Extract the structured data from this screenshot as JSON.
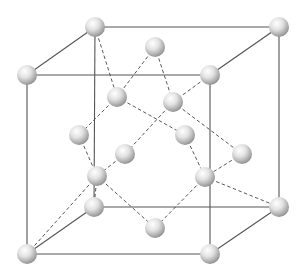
{
  "diagram": {
    "type": "crystal-lattice",
    "colors": {
      "background": "#ffffff",
      "edge": "#555555",
      "bond": "#444444",
      "atom_light": "#ffffff",
      "atom_mid": "#dcdcdc",
      "atom_dark": "#8e8e8e"
    },
    "atom_radius": 10,
    "atoms": [
      {
        "id": "btl",
        "x": 95,
        "y": 27
      },
      {
        "id": "btr",
        "x": 279,
        "y": 27
      },
      {
        "id": "ftl",
        "x": 27,
        "y": 75
      },
      {
        "id": "ftr",
        "x": 210,
        "y": 75
      },
      {
        "id": "tc",
        "x": 155,
        "y": 47
      },
      {
        "id": "i1",
        "x": 117,
        "y": 97
      },
      {
        "id": "i2",
        "x": 173,
        "y": 102
      },
      {
        "id": "lc",
        "x": 79,
        "y": 135
      },
      {
        "id": "i3",
        "x": 185,
        "y": 135
      },
      {
        "id": "fc",
        "x": 125,
        "y": 154
      },
      {
        "id": "rc",
        "x": 242,
        "y": 154
      },
      {
        "id": "i4",
        "x": 97,
        "y": 176
      },
      {
        "id": "i5",
        "x": 205,
        "y": 177
      },
      {
        "id": "bbl",
        "x": 94,
        "y": 207
      },
      {
        "id": "bbr",
        "x": 279,
        "y": 207
      },
      {
        "id": "bc",
        "x": 155,
        "y": 228
      },
      {
        "id": "fbl",
        "x": 27,
        "y": 254
      },
      {
        "id": "fbr",
        "x": 210,
        "y": 254
      }
    ],
    "edges": [
      [
        "btl",
        "btr"
      ],
      [
        "ftl",
        "ftr"
      ],
      [
        "bbl",
        "bbr"
      ],
      [
        "fbl",
        "fbr"
      ],
      [
        "btl",
        "bbl"
      ],
      [
        "btr",
        "bbr"
      ],
      [
        "ftl",
        "fbl"
      ],
      [
        "ftr",
        "fbr"
      ],
      [
        "btl",
        "ftl"
      ],
      [
        "btr",
        "ftr"
      ],
      [
        "bbl",
        "fbl"
      ],
      [
        "bbr",
        "fbr"
      ]
    ],
    "bonds": [
      [
        "btl",
        "i1"
      ],
      [
        "tc",
        "i1"
      ],
      [
        "tc",
        "i2"
      ],
      [
        "ftr",
        "i2"
      ],
      [
        "i1",
        "lc"
      ],
      [
        "i1",
        "i3"
      ],
      [
        "i2",
        "fc"
      ],
      [
        "fc",
        "i4"
      ],
      [
        "i2",
        "rc"
      ],
      [
        "lc",
        "i4"
      ],
      [
        "i3",
        "i5"
      ],
      [
        "rc",
        "i5"
      ],
      [
        "i4",
        "bc"
      ],
      [
        "i5",
        "bc"
      ],
      [
        "i4",
        "fbl"
      ],
      [
        "i4",
        "bbl"
      ],
      [
        "i5",
        "bbr"
      ]
    ]
  }
}
